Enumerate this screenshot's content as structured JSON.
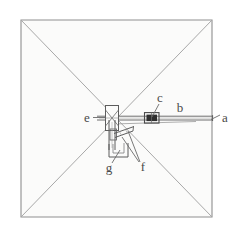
{
  "figure": {
    "type": "technical-line-drawing",
    "canvas": {
      "width": 238,
      "height": 244
    },
    "colors": {
      "background": "#ffffff",
      "panel_fill": "#fbfbfa",
      "frame_stroke": "#8f8f8f",
      "diagonal_stroke": "#a8a8a8",
      "part_stroke": "#5d5d5d",
      "leader_stroke": "#6a6a6a",
      "clamp_fill": "#2f2f2f",
      "label_text": "#4a4a4a"
    },
    "frame": {
      "name": "square-frame",
      "corners": {
        "top_left": [
          21,
          20
        ],
        "top_right": [
          212,
          20
        ],
        "bottom_right": [
          212,
          217
        ],
        "bottom_left": [
          21,
          217
        ]
      },
      "diagonals": [
        {
          "from": [
            21,
            20
          ],
          "to": [
            212,
            217
          ]
        },
        {
          "from": [
            212,
            20
          ],
          "to": [
            21,
            217
          ]
        }
      ],
      "center": [
        116,
        118
      ]
    },
    "rod": {
      "name": "horizontal-rod",
      "from": [
        96,
        118
      ],
      "to": [
        214,
        118
      ],
      "thickness_px": 4
    },
    "labels": [
      {
        "id": "a",
        "text": "a",
        "x": 225,
        "y": 118,
        "anchor": [
          212,
          118
        ],
        "note": "right end of rod"
      },
      {
        "id": "b",
        "text": "b",
        "x": 180,
        "y": 110,
        "anchor": null,
        "note": "rod body"
      },
      {
        "id": "c",
        "text": "c",
        "x": 160,
        "y": 101,
        "anchor": [
          152,
          117
        ],
        "note": "sliding clamp on rod"
      },
      {
        "id": "e",
        "text": "e",
        "x": 87,
        "y": 120,
        "anchor": [
          104,
          118
        ],
        "note": "central crossed block"
      },
      {
        "id": "f",
        "text": "f",
        "x": 142,
        "y": 168,
        "anchor": [
          126,
          137
        ],
        "note": "bracket arm joint"
      },
      {
        "id": "g",
        "text": "g",
        "x": 109,
        "y": 169,
        "anchor": [
          119,
          150
        ],
        "note": "lower bracket foot"
      }
    ],
    "parts": {
      "center_block": {
        "name": "center-crossed-block",
        "x": 106,
        "y": 106,
        "width": 13,
        "height": 24
      },
      "clamp": {
        "name": "rod-slider-clamp",
        "x": 144,
        "y": 113,
        "width": 15,
        "height": 9
      },
      "vertical_bar": {
        "name": "vertical-support-bar",
        "x": 109,
        "y": 120,
        "width": 6,
        "height": 28
      },
      "foot_bracket": {
        "name": "lower-foot-bracket",
        "points": "112,147 112,156 126,156 126,145"
      },
      "arm": {
        "name": "diagonal-arm",
        "from": [
          113,
          138
        ],
        "to": [
          133,
          128
        ]
      }
    }
  }
}
